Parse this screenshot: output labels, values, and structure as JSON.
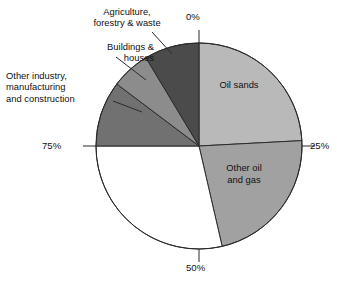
{
  "chart_data": {
    "type": "pie",
    "title": "",
    "subtitle": "",
    "xlabel": "",
    "ylabel": "",
    "legend_position": "callout-labels",
    "grid": false,
    "axis_ticks": [
      "0%",
      "25%",
      "50%",
      "75%"
    ],
    "start_angle_deg": 0,
    "direction": "clockwise",
    "categories": [
      "Oil sands",
      "Other oil and gas",
      "Unlabelled segment",
      "Other industry, manufacturing and construction",
      "Buildings & houses",
      "Agriculture, forestry & waste"
    ],
    "values": [
      24,
      22,
      29,
      10,
      6,
      9
    ],
    "slices": [
      {
        "name": "Oil sands",
        "label": "Oil sands",
        "value": 24,
        "start_deg": 0,
        "end_deg": 87,
        "color": "#b9b9b9",
        "label_placement": "inside"
      },
      {
        "name": "Other oil and gas",
        "label": "Other oil\nand gas",
        "value": 22,
        "start_deg": 87,
        "end_deg": 167,
        "color": "#a1a1a1",
        "label_placement": "inside"
      },
      {
        "name": "Unlabelled segment",
        "label": "",
        "value": 29,
        "start_deg": 167,
        "end_deg": 270,
        "color": "#ffffff",
        "label_placement": "none"
      },
      {
        "name": "Other industry, manufacturing and construction",
        "label": "Other industry,\nmanufacturing\nand construction",
        "value": 10,
        "start_deg": 270,
        "end_deg": 307,
        "color": "#717171",
        "label_placement": "callout-left"
      },
      {
        "name": "Buildings & houses",
        "label": "Buildings &\nhouses",
        "value": 6,
        "start_deg": 307,
        "end_deg": 329,
        "color": "#8c8c8c",
        "label_placement": "callout-upper-left"
      },
      {
        "name": "Agriculture, forestry & waste",
        "label": "Agriculture,\nforestry & waste",
        "value": 9,
        "start_deg": 329,
        "end_deg": 360,
        "color": "#4b4b4b",
        "label_placement": "callout-top"
      }
    ]
  },
  "labels": {
    "agriculture": "Agriculture,\nforestry & waste",
    "buildings": "Buildings &\nhouses",
    "other_industry": "Other industry,\nmanufacturing\nand construction",
    "oil_sands": "Oil sands",
    "other_oil_and_gas": "Other oil\nand gas"
  },
  "ticks": {
    "top": "0%",
    "right": "25%",
    "bottom": "50%",
    "left": "75%"
  },
  "colors": {
    "oil_sands": "#b9b9b9",
    "other_oil_and_gas": "#a1a1a1",
    "unlabelled": "#ffffff",
    "other_industry": "#717171",
    "buildings": "#8c8c8c",
    "agriculture": "#4b4b4b",
    "outline": "#2b2b2b",
    "text": "#111111",
    "background": "#ffffff"
  }
}
